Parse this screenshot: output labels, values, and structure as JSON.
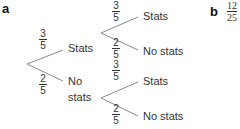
{
  "part_a": {
    "label": "a",
    "level1": {
      "upper": {
        "prob_num": "3",
        "prob_den": "5",
        "outcome": "Stats"
      },
      "lower": {
        "prob_num": "2",
        "prob_den": "5",
        "outcome_line1": "No",
        "outcome_line2": "stats"
      }
    },
    "level2_from_stats": {
      "upper": {
        "prob_num": "3",
        "prob_den": "5",
        "outcome": "Stats"
      },
      "lower": {
        "prob_num": "2",
        "prob_den": "5",
        "outcome": "No stats"
      }
    },
    "level2_from_no_stats": {
      "upper": {
        "prob_num": "3",
        "prob_den": "5",
        "outcome": "Stats"
      },
      "lower": {
        "prob_num": "2",
        "prob_den": "5",
        "outcome": "No stats"
      }
    }
  },
  "part_b": {
    "label": "b",
    "answer_num": "12",
    "answer_den": "25"
  }
}
